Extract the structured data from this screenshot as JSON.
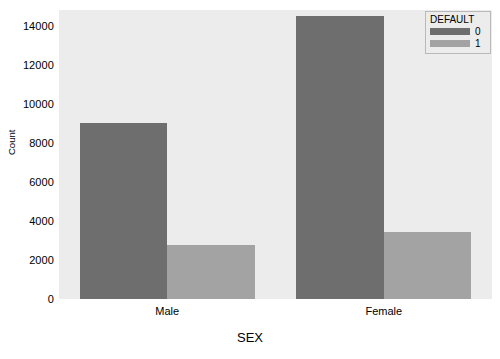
{
  "chart_data": {
    "type": "bar",
    "title": "",
    "subtitle": "",
    "xlabel": "SEX",
    "ylabel": "Count",
    "categories": [
      "Male",
      "Female"
    ],
    "series": [
      {
        "name": "0",
        "values": [
          9000,
          14500
        ],
        "color": "#6e6e6e"
      },
      {
        "name": "1",
        "values": [
          2750,
          3450
        ],
        "color": "#a3a3a3"
      }
    ],
    "legend": {
      "title": "DEFAULT",
      "position": "upper right",
      "entries": [
        "0",
        "1"
      ]
    },
    "ylim": [
      0,
      14800
    ],
    "yticks": [
      0,
      2000,
      4000,
      6000,
      8000,
      10000,
      12000,
      14000
    ],
    "ytick_labels": [
      "0",
      "2000",
      "4000",
      "6000",
      "8000",
      "10000",
      "12000",
      "14000"
    ],
    "xtick_labels": [
      "Male",
      "Female"
    ],
    "grid": false,
    "plot_background": "#ececec",
    "figure_background": "#ffffff"
  }
}
